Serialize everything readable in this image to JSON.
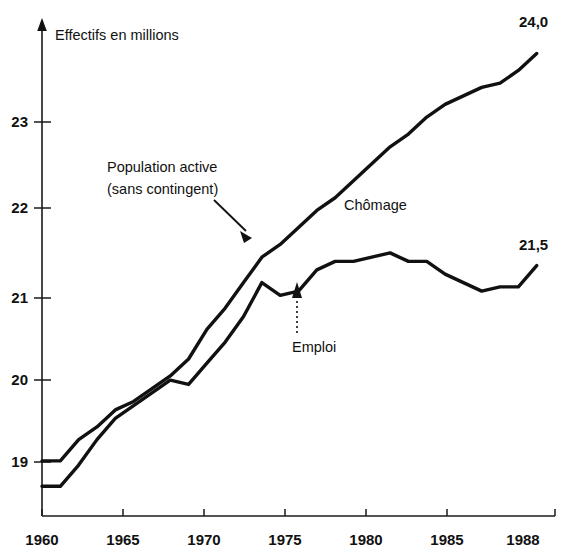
{
  "chart_data": {
    "type": "line",
    "title": "",
    "ylabel": "Effectifs en millions",
    "xlabel": "",
    "xlim": [
      1960,
      1988
    ],
    "ylim": [
      18.55,
      24.3
    ],
    "grid": false,
    "legend_position": "inline-annotations",
    "y_ticks": [
      "19",
      "20",
      "21",
      "22",
      "23"
    ],
    "y_tick_values": [
      19,
      20,
      21,
      22,
      23
    ],
    "x_ticks": [
      "1960",
      "1965",
      "1970",
      "1975",
      "1980",
      "1985",
      "1988"
    ],
    "x_tick_values": [
      1960,
      1965,
      1970,
      1975,
      1980,
      1985,
      1988
    ],
    "series": [
      {
        "name": "Population active (sans contingent)",
        "end_label": "24,0",
        "x": [
          1960,
          1961,
          1962,
          1963,
          1964,
          1965,
          1966,
          1967,
          1968,
          1969,
          1970,
          1971,
          1972,
          1973,
          1974,
          1975,
          1976,
          1977,
          1978,
          1979,
          1980,
          1981,
          1982,
          1983,
          1984,
          1985,
          1986,
          1987
        ],
        "values": [
          19.2,
          19.2,
          19.45,
          19.6,
          19.8,
          19.9,
          20.05,
          20.2,
          20.4,
          20.75,
          21.0,
          21.3,
          21.6,
          21.75,
          21.95,
          22.15,
          22.3,
          22.5,
          22.7,
          22.9,
          23.05,
          23.25,
          23.4,
          23.5,
          23.6,
          23.65,
          23.8,
          24.0
        ]
      },
      {
        "name": "Emploi",
        "end_label": "21,5",
        "x": [
          1960,
          1961,
          1962,
          1963,
          1964,
          1965,
          1966,
          1967,
          1968,
          1969,
          1970,
          1971,
          1972,
          1973,
          1974,
          1975,
          1976,
          1977,
          1978,
          1979,
          1980,
          1981,
          1982,
          1983,
          1984,
          1985,
          1986,
          1987
        ],
        "values": [
          18.9,
          18.9,
          19.15,
          19.45,
          19.7,
          19.85,
          20.0,
          20.15,
          20.1,
          20.35,
          20.6,
          20.9,
          21.3,
          21.15,
          21.2,
          21.45,
          21.55,
          21.55,
          21.6,
          21.65,
          21.55,
          21.55,
          21.4,
          21.3,
          21.2,
          21.25,
          21.25,
          21.5
        ]
      }
    ],
    "annotations": [
      {
        "name": "population-active-annotation",
        "line1": "Population active",
        "line2": "(sans contingent)",
        "arrow": "solid-down-right"
      },
      {
        "name": "chomage-annotation",
        "line1": "Chômage",
        "line2": "",
        "arrow": "none"
      },
      {
        "name": "emploi-annotation",
        "line1": "Emploi",
        "line2": "",
        "arrow": "dotted-up"
      }
    ]
  }
}
